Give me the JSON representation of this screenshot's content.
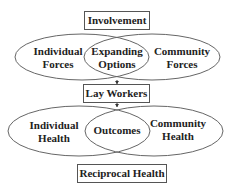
{
  "diagram": {
    "top_box": "Involvement",
    "top_circles": {
      "left": [
        "Individual",
        "Forces"
      ],
      "center": [
        "Expanding",
        "Options"
      ],
      "right": [
        "Community",
        "Forces"
      ]
    },
    "middle_box": "Lay Workers",
    "bottom_circles": {
      "left": [
        "Individual",
        "Health"
      ],
      "center": "Outcomes",
      "right": [
        "Community",
        "Health"
      ]
    },
    "bottom_box": "Reciprocal Health"
  },
  "colors": {
    "stroke": "#555555",
    "text": "#222222",
    "background": "#ffffff"
  }
}
